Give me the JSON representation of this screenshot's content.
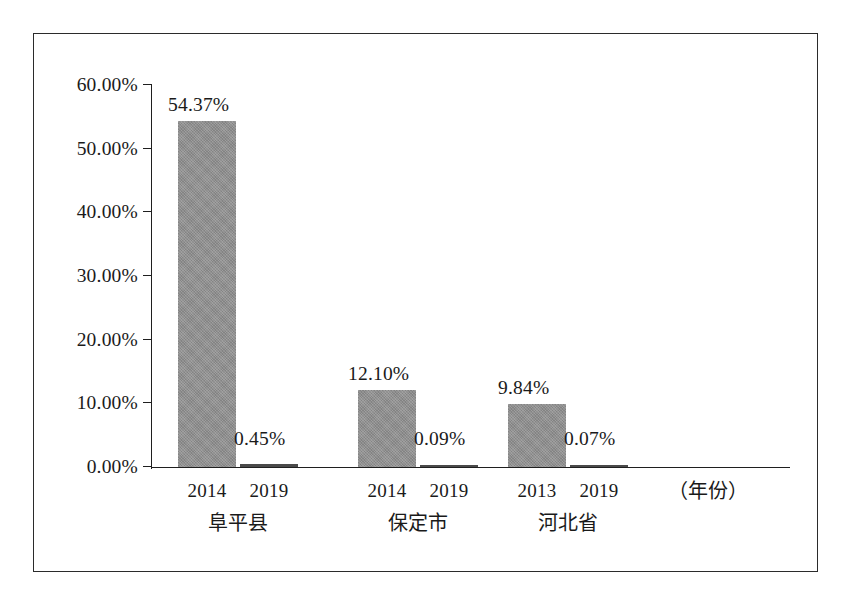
{
  "chart_data": {
    "type": "bar",
    "title": "",
    "subtitle": "",
    "xlabel": "（年份）",
    "ylabel": "",
    "ylim": [
      0,
      60
    ],
    "grid": false,
    "legend": null,
    "y_ticks": [
      "0.00%",
      "10.00%",
      "20.00%",
      "30.00%",
      "40.00%",
      "50.00%",
      "60.00%"
    ],
    "y_tick_values": [
      0,
      10,
      20,
      30,
      40,
      50,
      60
    ],
    "bar_color": "#8d8d8d",
    "groups": [
      {
        "name": "阜平县",
        "bars": [
          {
            "year": "2014",
            "value": 54.37,
            "label": "54.37%"
          },
          {
            "year": "2019",
            "value": 0.45,
            "label": "0.45%"
          }
        ]
      },
      {
        "name": "保定市",
        "bars": [
          {
            "year": "2014",
            "value": 12.1,
            "label": "12.10%"
          },
          {
            "year": "2019",
            "value": 0.09,
            "label": "0.09%"
          }
        ]
      },
      {
        "name": "河北省",
        "bars": [
          {
            "year": "2013",
            "value": 9.84,
            "label": "9.84%"
          },
          {
            "year": "2019",
            "value": 0.07,
            "label": "0.07%"
          }
        ]
      }
    ],
    "categories": [
      "阜平县 2014",
      "阜平县 2019",
      "保定市 2014",
      "保定市 2019",
      "河北省 2013",
      "河北省 2019"
    ],
    "values": [
      54.37,
      0.45,
      12.1,
      0.09,
      9.84,
      0.07
    ]
  }
}
